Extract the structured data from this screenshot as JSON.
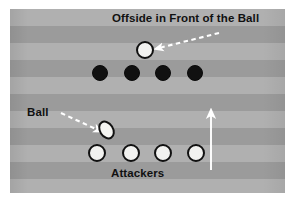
{
  "diagram": {
    "title": "Offside in Front of the Ball",
    "labels": {
      "title": "Offside in Front of the Ball",
      "ball": "Ball",
      "attackers": "Attackers"
    },
    "colors": {
      "field_light": "#b0b0b0",
      "field_dark": "#9b9b9b",
      "defender_fill": "#111111",
      "attacker_fill": "#f2f2f0",
      "outline": "#111111",
      "arrow_white": "#ffffff",
      "text": "#111111",
      "page_background": "#ffffff"
    },
    "field": {
      "stripe_count": 11,
      "stripe_height": 17,
      "orientation": "horizontal"
    },
    "offside_player": {
      "role": "attacker",
      "shape": "circle-outline",
      "x": 145,
      "y": 50,
      "radius": 9
    },
    "defenders": {
      "role": "defenders",
      "shape": "filled-circle",
      "count": 4,
      "y": 73,
      "radius": 8,
      "x_positions": [
        100,
        132,
        163,
        195
      ]
    },
    "attackers": {
      "role": "attackers",
      "shape": "circle-outline",
      "count": 4,
      "y": 153,
      "radius": 9,
      "x_positions": [
        97,
        131,
        163,
        196
      ]
    },
    "ball": {
      "shape": "oval",
      "x": 106,
      "y": 130,
      "width": 15,
      "height": 20,
      "rotation_deg": -32
    },
    "arrows": [
      {
        "name": "offside-pointer",
        "style": "dashed",
        "color": "#ffffff",
        "from_x": 219,
        "from_y": 33,
        "to_x": 159,
        "to_y": 48
      },
      {
        "name": "ball-pointer",
        "style": "dashed",
        "color": "#ffffff",
        "from_x": 61,
        "from_y": 113,
        "to_x": 98,
        "to_y": 130
      },
      {
        "name": "direction-of-play",
        "style": "solid",
        "color": "#ffffff",
        "from_x": 211,
        "from_y": 170,
        "to_x": 211,
        "to_y": 114
      }
    ],
    "label_positions": {
      "title": {
        "x": 112,
        "y": 12
      },
      "ball": {
        "x": 27,
        "y": 106
      },
      "attackers": {
        "x": 111,
        "y": 167
      }
    }
  }
}
